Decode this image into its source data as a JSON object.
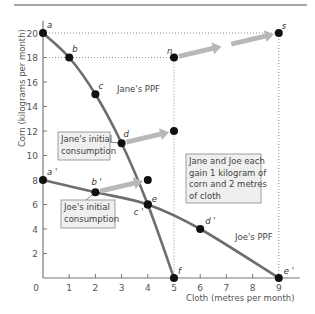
{
  "chart_data": {
    "type": "line",
    "title": "",
    "xlabel": "Cloth (metres per month)",
    "ylabel": "Corn (kilograms per month)",
    "xlim": [
      0,
      9.8
    ],
    "ylim": [
      0,
      21
    ],
    "x_ticks": [
      1,
      2,
      3,
      4,
      5,
      6,
      7,
      8,
      9
    ],
    "y_ticks": [
      2,
      4,
      6,
      8,
      10,
      12,
      14,
      16,
      18,
      20
    ],
    "origin_label": "0",
    "grid": false,
    "colors": {
      "ppf": "#6e6e6e",
      "point": "#111111",
      "arrow": "#b8b8b8",
      "axis": "#777777",
      "box_fill": "#efefef",
      "box_stroke": "#888888",
      "top_rule": "#8a8a8a"
    },
    "series": [
      {
        "name": "Jane's PPF",
        "label": "Jane's PPF",
        "points": [
          {
            "x": 0,
            "y": 20,
            "label": "a"
          },
          {
            "x": 1,
            "y": 18,
            "label": "b"
          },
          {
            "x": 2,
            "y": 15,
            "label": "c"
          },
          {
            "x": 3,
            "y": 11,
            "label": "d"
          },
          {
            "x": 4,
            "y": 6,
            "label": "e"
          },
          {
            "x": 5,
            "y": 0,
            "label": "f"
          }
        ]
      },
      {
        "name": "Joe's PPF",
        "label": "Joe's PPF",
        "points": [
          {
            "x": 0,
            "y": 8,
            "label": "a '"
          },
          {
            "x": 2,
            "y": 7,
            "label": "b '"
          },
          {
            "x": 4,
            "y": 6,
            "label": "c '"
          },
          {
            "x": 6,
            "y": 4,
            "label": "d '"
          },
          {
            "x": 9,
            "y": 0,
            "label": "e '"
          }
        ]
      }
    ],
    "extra_points": [
      {
        "x": 5,
        "y": 12,
        "label": ""
      },
      {
        "x": 4,
        "y": 8,
        "label": ""
      },
      {
        "x": 5,
        "y": 18,
        "label": "n"
      },
      {
        "x": 9,
        "y": 20,
        "label": "s"
      }
    ],
    "arrows": [
      {
        "from": [
          3,
          11
        ],
        "to": [
          5,
          12
        ]
      },
      {
        "from": [
          2,
          7
        ],
        "to": [
          4,
          8
        ]
      },
      {
        "from": [
          5,
          18
        ],
        "to": [
          7,
          19
        ]
      },
      {
        "from": [
          7,
          19
        ],
        "to": [
          9,
          20
        ]
      }
    ],
    "guide_lines": [
      {
        "from": [
          0,
          20
        ],
        "to": [
          9,
          20
        ]
      },
      {
        "from": [
          0,
          18
        ],
        "to": [
          5,
          18
        ]
      },
      {
        "from": [
          5,
          18
        ],
        "to": [
          5,
          0
        ]
      },
      {
        "from": [
          9,
          20
        ],
        "to": [
          9,
          0
        ]
      }
    ],
    "annotations": [
      {
        "id": "jane-box",
        "lines": [
          "Jane's initial",
          "consumption"
        ],
        "points_to": [
          3,
          11
        ]
      },
      {
        "id": "joe-box",
        "lines": [
          "Joe's initial",
          "consumption"
        ],
        "points_to": [
          2,
          7
        ]
      },
      {
        "id": "gain-box",
        "lines": [
          "Jane and Joe each",
          "gain 1 kilogram of",
          "corn and 2 metres",
          "of cloth"
        ]
      }
    ]
  }
}
